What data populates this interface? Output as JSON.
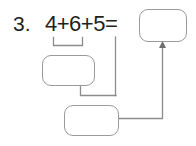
{
  "problem": {
    "number_label": "3.",
    "equation": "4+6+5=",
    "addends": [
      4,
      6,
      5
    ],
    "operator": "+",
    "equals": "="
  },
  "boxes": [
    {
      "id": "total",
      "value": "",
      "placeholder": ""
    },
    {
      "id": "partial-sum",
      "value": "",
      "placeholder": ""
    },
    {
      "id": "step",
      "value": "",
      "placeholder": ""
    }
  ],
  "annotations": {
    "grouping_bracket_label": "",
    "arrow_label": ""
  },
  "colors": {
    "text": "#231f20",
    "box_border": "#9a9a9a",
    "connector": "#8c8c8c",
    "background": "#ffffff"
  }
}
